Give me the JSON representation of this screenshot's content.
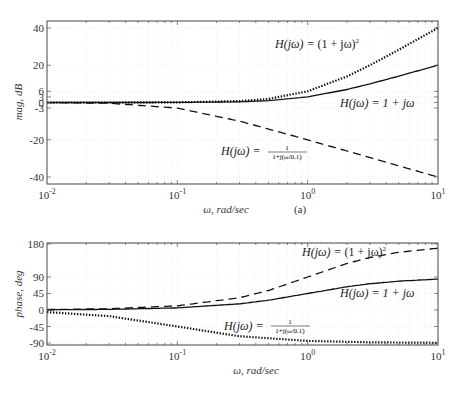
{
  "chart_data": [
    {
      "type": "line",
      "panel": "magnitude",
      "title": "",
      "caption": "(a)",
      "xlabel": "ω, rad/sec",
      "ylabel": "mag, dB",
      "xscale": "log",
      "xlim": [
        0.01,
        10
      ],
      "ylim": [
        -43,
        44
      ],
      "grid": true,
      "x_ticks": [
        0.01,
        0.1,
        1,
        10
      ],
      "x_tick_labels": [
        "10^-2",
        "10^-1",
        "10^0",
        "10^1"
      ],
      "y_ticks": [
        40,
        20,
        6,
        3,
        0,
        -3,
        -20,
        -40
      ],
      "y_tick_labels": [
        "40",
        "20",
        "6",
        "3",
        "0",
        "-3",
        "-20",
        "-40"
      ],
      "series": [
        {
          "name": "H(jω) = (1 + jω)^2",
          "style": "dotted",
          "x": [
            0.01,
            0.03,
            0.1,
            0.3,
            0.5,
            1,
            2,
            3,
            5,
            10
          ],
          "values": [
            0.0,
            0.01,
            0.09,
            0.76,
            1.94,
            6.02,
            13.98,
            20.0,
            28.3,
            40.09
          ]
        },
        {
          "name": "H(jω) = 1 + jω",
          "style": "solid",
          "x": [
            0.01,
            0.03,
            0.1,
            0.3,
            0.5,
            1,
            2,
            3,
            5,
            10
          ],
          "values": [
            0.0,
            0.0,
            0.04,
            0.38,
            0.97,
            3.01,
            6.99,
            10.0,
            14.15,
            20.04
          ]
        },
        {
          "name": "H(jω) = 1/(1 + j(ω/0.1))",
          "style": "dashed",
          "x": [
            0.01,
            0.03,
            0.1,
            0.3,
            1,
            3,
            10
          ],
          "values": [
            -0.04,
            -0.38,
            -3.01,
            -10.0,
            -20.04,
            -29.55,
            -40.0
          ]
        }
      ],
      "annotations": [
        {
          "text": "H(jω) = (1 + jω)²",
          "x": 1.2,
          "y": 33
        },
        {
          "text": "H(jω) = 1 + jω",
          "x": 1.8,
          "y": 1
        },
        {
          "text": "H(jω) = 1/(1+j(ω/0.1))",
          "x": 0.2,
          "y": -22
        }
      ]
    },
    {
      "type": "line",
      "panel": "phase",
      "title": "",
      "xlabel": "ω, rad/sec",
      "ylabel": "phase, deg",
      "xscale": "log",
      "xlim": [
        0.01,
        10
      ],
      "ylim": [
        -92,
        182
      ],
      "grid": true,
      "x_ticks": [
        0.01,
        0.1,
        1,
        10
      ],
      "x_tick_labels": [
        "10^-2",
        "10^-1",
        "10^0",
        "10^1"
      ],
      "y_ticks": [
        180,
        90,
        45,
        0,
        -45,
        -90
      ],
      "y_tick_labels": [
        "180",
        "90",
        "45",
        "0",
        "-45",
        "-90"
      ],
      "series": [
        {
          "name": "H(jω) = (1 + jω)^2",
          "style": "dashed",
          "x": [
            0.01,
            0.03,
            0.1,
            0.3,
            0.5,
            1,
            2,
            3,
            5,
            10
          ],
          "values": [
            1.15,
            3.44,
            11.42,
            33.4,
            53.13,
            90.0,
            126.87,
            143.13,
            157.38,
            168.58
          ]
        },
        {
          "name": "H(jω) = 1 + jω",
          "style": "solid",
          "x": [
            0.01,
            0.03,
            0.1,
            0.3,
            0.5,
            1,
            2,
            3,
            5,
            10
          ],
          "values": [
            0.57,
            1.72,
            5.71,
            16.7,
            26.57,
            45.0,
            63.43,
            71.57,
            78.69,
            84.29
          ]
        },
        {
          "name": "H(jω) = 1/(1 + j(ω/0.1))",
          "style": "dotted",
          "x": [
            0.01,
            0.03,
            0.1,
            0.3,
            1,
            3,
            10
          ],
          "values": [
            -5.71,
            -16.7,
            -45.0,
            -71.57,
            -84.29,
            -88.09,
            -89.43
          ]
        }
      ],
      "annotations": [
        {
          "text": "H(jω) = (1 + jω)²",
          "x": 1.1,
          "y": 170
        },
        {
          "text": "H(jω) = 1 + jω",
          "x": 1.8,
          "y": 60
        },
        {
          "text": "H(jω) = 1/(1+j(ω/0.1))",
          "x": 0.2,
          "y": -60
        }
      ]
    }
  ],
  "labels": {
    "mag_ylabel": "mag, dB",
    "phase_ylabel": "phase, deg",
    "xlabel": "ω, rad/sec",
    "caption": "(a)",
    "H_prefix": "H(jω) = ",
    "sq_expr": "(1 + jω)",
    "sq_pow": "2",
    "lin_expr": "1 + jω",
    "frac_num": "1",
    "frac_den": "1+j(ω/0.1)"
  }
}
